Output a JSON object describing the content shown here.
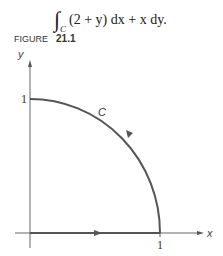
{
  "equation": {
    "integral_symbol": "∫",
    "subscript": "C",
    "text": "(2 + y) dx + x dy."
  },
  "figure": {
    "label": "FIGURE",
    "number": "21.1"
  },
  "diagram": {
    "y_axis_label": "y",
    "x_axis_label": "x",
    "y_tick_label": "1",
    "x_tick_label": "1",
    "curve_label": "C",
    "line_color": "#555555"
  }
}
